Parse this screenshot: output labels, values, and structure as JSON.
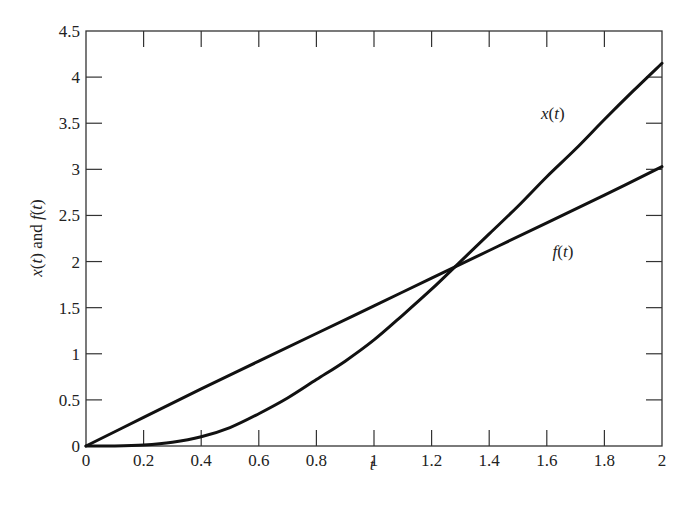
{
  "chart_data": {
    "type": "line",
    "title": "",
    "xlabel": "t",
    "ylabel": "x(t) and f(t)",
    "xlim": [
      0,
      2
    ],
    "ylim": [
      0,
      4.5
    ],
    "grid": false,
    "legend": "inline labels",
    "xticks": [
      "0",
      "0.2",
      "0.4",
      "0.6",
      "0.8",
      "1",
      "1.2",
      "1.4",
      "1.6",
      "1.8",
      "2"
    ],
    "yticks": [
      "0",
      "0.5",
      "1",
      "1.5",
      "2",
      "2.5",
      "3",
      "3.5",
      "4",
      "4.5"
    ],
    "series": [
      {
        "name": "x(t)",
        "label_position": [
          1.58,
          3.55
        ],
        "x": [
          0,
          0.1,
          0.2,
          0.3,
          0.4,
          0.5,
          0.6,
          0.7,
          0.8,
          0.9,
          1.0,
          1.1,
          1.2,
          1.3,
          1.4,
          1.5,
          1.6,
          1.7,
          1.8,
          1.9,
          2.0
        ],
        "values": [
          0,
          0.0,
          0.01,
          0.04,
          0.1,
          0.2,
          0.35,
          0.52,
          0.72,
          0.92,
          1.15,
          1.42,
          1.7,
          2.0,
          2.3,
          2.6,
          2.92,
          3.22,
          3.54,
          3.85,
          4.15
        ]
      },
      {
        "name": "f(t)",
        "label_position": [
          1.62,
          2.05
        ],
        "x": [
          0,
          0.2,
          0.4,
          0.6,
          0.8,
          1.0,
          1.2,
          1.4,
          1.6,
          1.8,
          2.0
        ],
        "values": [
          0,
          0.31,
          0.62,
          0.92,
          1.22,
          1.52,
          1.82,
          2.12,
          2.42,
          2.72,
          3.03
        ]
      }
    ]
  },
  "axes": {
    "xlabel_text": "t",
    "ylabel_parts": [
      "x",
      "(",
      "t",
      ") and ",
      "f",
      "(",
      "t",
      ")"
    ]
  },
  "colors": {
    "line": "#111111",
    "frame": "#333333",
    "background": "#ffffff"
  }
}
